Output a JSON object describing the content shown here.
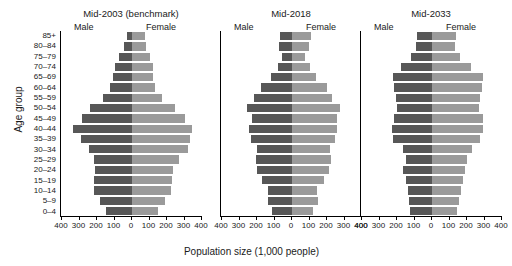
{
  "chart_data": {
    "type": "bar",
    "title": "",
    "xlabel": "Population size (1,000 people)",
    "ylabel": "Age group",
    "grid": false,
    "legend_position": "in-panel",
    "legend": [
      "Male",
      "Female"
    ],
    "xlim": [
      -400,
      400
    ],
    "xticks": [
      400,
      300,
      200,
      100,
      0,
      100,
      200,
      300,
      400
    ],
    "categories": [
      "85+",
      "80–84",
      "75–79",
      "70–74",
      "65–69",
      "60–64",
      "55–59",
      "50–54",
      "45–49",
      "40–44",
      "35–39",
      "30–34",
      "25–29",
      "20–24",
      "15–19",
      "10–14",
      "5–9",
      "0–4"
    ],
    "panels": [
      {
        "title": "Mid-2003 (benchmark)",
        "male_label": "Male",
        "female_label": "Female",
        "series": [
          {
            "name": "Male",
            "values": [
              30,
              44,
              72,
              98,
              110,
              128,
              165,
              240,
              285,
              335,
              290,
              245,
              215,
              210,
              218,
              220,
              182,
              150
            ]
          },
          {
            "name": "Female",
            "values": [
              72,
              80,
              100,
              120,
              120,
              132,
              170,
              248,
              300,
              345,
              330,
              320,
              268,
              235,
              228,
              224,
              190,
              150
            ]
          }
        ]
      },
      {
        "title": "Mid-2018",
        "male_label": "Male",
        "female_label": "Female",
        "series": [
          {
            "name": "Male",
            "values": [
              68,
              72,
              58,
              80,
              118,
              180,
              215,
              260,
              230,
              245,
              235,
              200,
              205,
              200,
              170,
              135,
              140,
              115
            ]
          },
          {
            "name": "Female",
            "values": [
              110,
              98,
              75,
              100,
              135,
              200,
              230,
              275,
              255,
              258,
              248,
              218,
              222,
              213,
              180,
              143,
              148,
              120
            ]
          }
        ]
      },
      {
        "title": "Mid-2033",
        "male_label": "Male",
        "female_label": "Female",
        "series": [
          {
            "name": "Male",
            "values": [
              85,
              90,
              120,
              175,
              225,
              218,
              205,
              200,
              215,
              230,
              225,
              165,
              150,
              165,
              150,
              140,
              130,
              125
            ]
          },
          {
            "name": "Female",
            "values": [
              135,
              130,
              160,
              225,
              290,
              285,
              275,
              270,
              290,
              290,
              275,
              230,
              200,
              190,
              175,
              165,
              155,
              140
            ]
          }
        ]
      }
    ]
  }
}
